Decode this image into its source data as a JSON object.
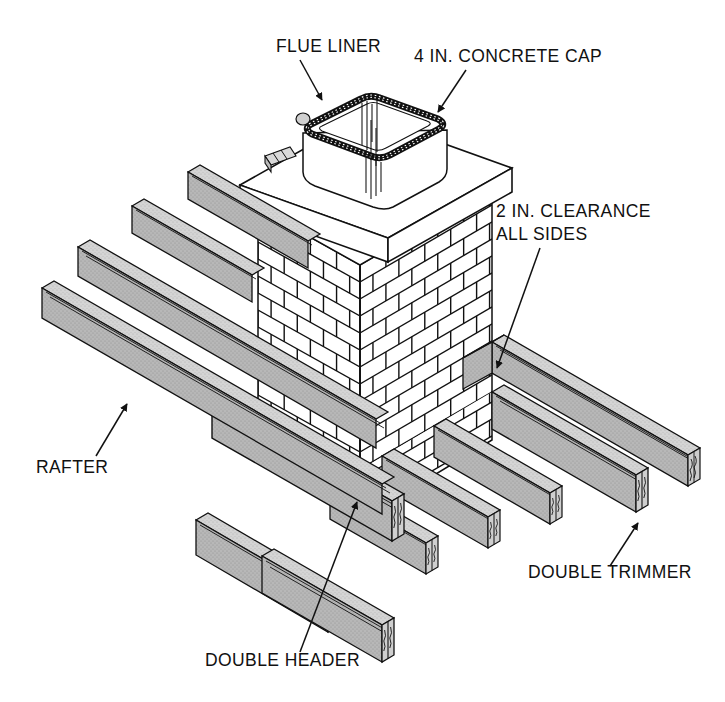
{
  "figure": {
    "background_color": "#ffffff",
    "line_color": "#111111",
    "beam_fill": "#b4b4b4",
    "beam_top_fill": "#d2d2d2",
    "cap_fill": "#ffffff",
    "brick_fill": "#ffffff"
  },
  "labels": [
    {
      "id": "flue-liner",
      "text": "FLUE LINER",
      "x": 276,
      "y": 52,
      "anchor": "start"
    },
    {
      "id": "concrete-cap",
      "text": "4 IN. CONCRETE CAP",
      "x": 414,
      "y": 62,
      "anchor": "start"
    },
    {
      "id": "clearance-line1",
      "text": "2 IN. CLEARANCE",
      "x": 496,
      "y": 217,
      "anchor": "start"
    },
    {
      "id": "clearance-line2",
      "text": "ALL SIDES",
      "x": 496,
      "y": 240,
      "anchor": "start"
    },
    {
      "id": "rafter",
      "text": "RAFTER",
      "x": 36,
      "y": 473,
      "anchor": "start"
    },
    {
      "id": "double-trimmer",
      "text": "DOUBLE TRIMMER",
      "x": 528,
      "y": 578,
      "anchor": "start"
    },
    {
      "id": "double-header",
      "text": "DOUBLE HEADER",
      "x": 205,
      "y": 666,
      "anchor": "start"
    }
  ],
  "leaders": [
    {
      "id": "leader-flue-liner",
      "from": [
        300,
        60
      ],
      "to": [
        322,
        100
      ]
    },
    {
      "id": "leader-concrete-cap",
      "from": [
        466,
        70
      ],
      "to": [
        438,
        112
      ]
    },
    {
      "id": "leader-clearance",
      "from": [
        540,
        248
      ],
      "to": [
        497,
        368
      ]
    },
    {
      "id": "leader-rafter",
      "from": [
        96,
        456
      ],
      "to": [
        127,
        404
      ]
    },
    {
      "id": "leader-double-trimmer",
      "from": [
        610,
        566
      ],
      "to": [
        638,
        523
      ]
    },
    {
      "id": "leader-double-header",
      "from": [
        300,
        652
      ],
      "to": [
        357,
        502
      ]
    }
  ],
  "components": {
    "chimney": {
      "name": "brick chimney",
      "bond": "running bond"
    },
    "cap": {
      "name": "concrete cap",
      "thickness_in": 4
    },
    "flue": {
      "name": "flue liner"
    },
    "clearance_in": 2,
    "rafters_count": 4,
    "trimmers_count": 2,
    "headers_count": 2
  }
}
